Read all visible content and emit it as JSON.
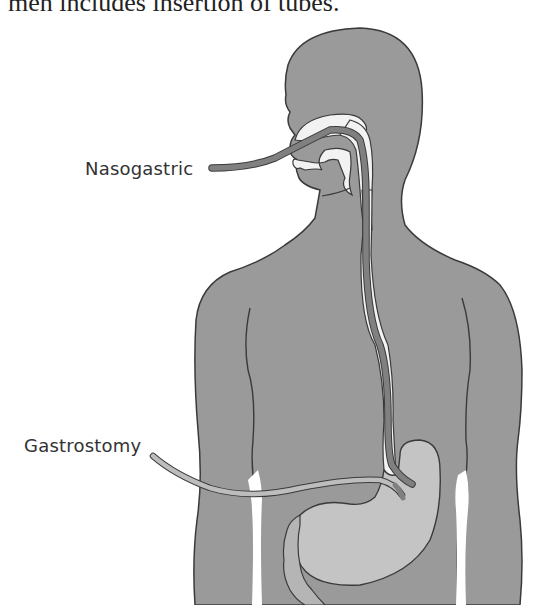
{
  "header": {
    "text": "men includes insertion of tubes."
  },
  "diagram": {
    "labels": {
      "nasogastric": "Nasogastric",
      "gastrostomy": "Gastrostomy"
    },
    "colors": {
      "body": "#9a9a9a",
      "outline": "#3a3a3a",
      "tube": "#808080",
      "tube_light": "#bdbdbd",
      "airway": "#f2f2f2",
      "stomach": "#c4c4c4",
      "background": "#ffffff"
    }
  }
}
